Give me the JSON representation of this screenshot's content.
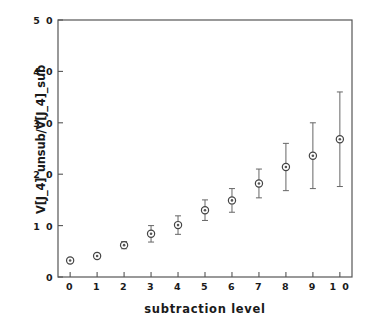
{
  "chart_data": {
    "type": "scatter",
    "title": "",
    "xlabel": "subtraction level",
    "ylabel": "V[J_4]_unsub/V[J_4]_sub",
    "xlim": [
      -0.45,
      10.45
    ],
    "ylim": [
      0,
      5.0
    ],
    "grid": false,
    "legend": null,
    "marker": "circle-with-dot",
    "error_bars": "vertical",
    "xticks": [
      0,
      1,
      2,
      3,
      4,
      5,
      6,
      7,
      8,
      9,
      10
    ],
    "xtick_labels": [
      "0",
      "1",
      "2",
      "3",
      "4",
      "5",
      "6",
      "7",
      "8",
      "9",
      "1 0"
    ],
    "yticks": [
      0,
      1.0,
      2.0,
      3.0,
      4.0,
      5.0
    ],
    "ytick_labels": [
      "0",
      "1 0",
      "2 0",
      "3 0",
      "4 0",
      "5 0"
    ],
    "x": [
      0,
      1,
      2,
      3,
      4,
      5,
      6,
      7,
      8,
      9,
      10
    ],
    "values": [
      0.32,
      0.41,
      0.62,
      0.84,
      1.01,
      1.3,
      1.49,
      1.82,
      2.14,
      2.36,
      2.68
    ],
    "errors": [
      0.03,
      0.05,
      0.07,
      0.16,
      0.18,
      0.2,
      0.23,
      0.28,
      0.46,
      0.64,
      0.92
    ],
    "series": [
      {
        "name": "V[J_4]_unsub/V[J_4]_sub",
        "categories": [
          "0",
          "1",
          "2",
          "3",
          "4",
          "5",
          "6",
          "7",
          "8",
          "9",
          "10"
        ],
        "values": [
          0.32,
          0.41,
          0.62,
          0.84,
          1.01,
          1.3,
          1.49,
          1.82,
          2.14,
          2.36,
          2.68
        ],
        "errors": [
          0.03,
          0.05,
          0.07,
          0.16,
          0.18,
          0.2,
          0.23,
          0.28,
          0.46,
          0.64,
          0.92
        ]
      }
    ],
    "colors": {
      "axis": "#555555",
      "marker_edge": "#444444",
      "marker_face": "#ffffff",
      "marker_dot": "#555555",
      "errorbar": "#666666",
      "text": "#1a1a1a",
      "background": "#ffffff"
    }
  }
}
